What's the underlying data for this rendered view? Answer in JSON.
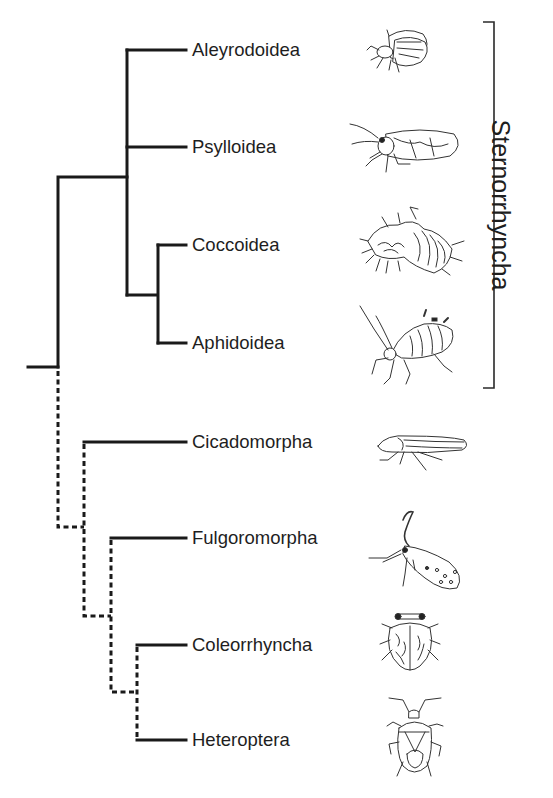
{
  "figure": {
    "type": "phylogenetic-tree",
    "clade_bracket": {
      "label": "Sternorrhyncha",
      "top_y": 22,
      "bottom_y": 388
    },
    "taxa": [
      {
        "label": "Aleyrodoidea",
        "y": 50,
        "icon": "whitefly-icon",
        "group": "Sternorrhyncha"
      },
      {
        "label": "Psylloidea",
        "y": 147,
        "icon": "psyllid-icon",
        "group": "Sternorrhyncha"
      },
      {
        "label": "Coccoidea",
        "y": 245,
        "icon": "scale-insect-icon",
        "group": "Sternorrhyncha"
      },
      {
        "label": "Aphidoidea",
        "y": 343,
        "icon": "aphid-icon",
        "group": "Sternorrhyncha"
      },
      {
        "label": "Cicadomorpha",
        "y": 442,
        "icon": "leafhopper-icon",
        "group": ""
      },
      {
        "label": "Fulgoromorpha",
        "y": 538,
        "icon": "planthopper-icon",
        "group": ""
      },
      {
        "label": "Coleorrhyncha",
        "y": 645,
        "icon": "moss-bug-icon",
        "group": ""
      },
      {
        "label": "Heteroptera",
        "y": 740,
        "icon": "true-bug-icon",
        "group": ""
      }
    ],
    "branch_styles": {
      "solid": "Sternorrhyncha lineage and terminal branches",
      "dashed": "basal relationships of remaining lineages"
    },
    "line_color": "#1a1a1a"
  }
}
